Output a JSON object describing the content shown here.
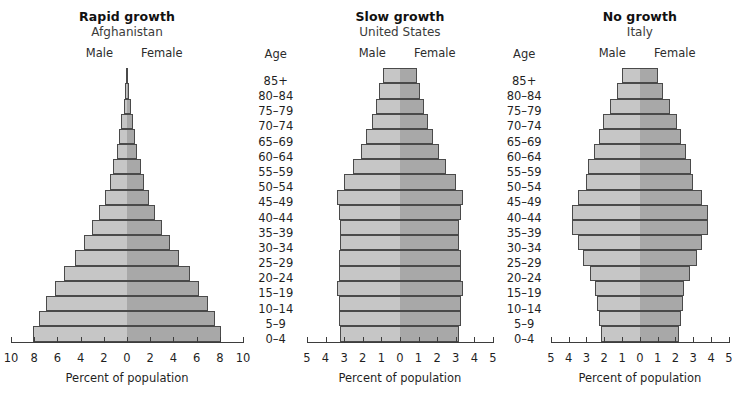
{
  "figure": {
    "caption": "Percent of population",
    "male_label": "Male",
    "female_label": "Female",
    "age_header": "Age",
    "colors": {
      "male_bar": "#c6c6c6",
      "female_bar": "#a8a8a8",
      "bar_outline": "#4a4a4a",
      "axis": "#3d3d3d",
      "background": "#ffffff",
      "text": "#1f1f1f"
    }
  },
  "age_groups": [
    "85+",
    "80–84",
    "75–79",
    "70–74",
    "65–69",
    "60–64",
    "55–59",
    "50–54",
    "45–49",
    "40–44",
    "35–39",
    "30–34",
    "25–29",
    "20–24",
    "15–19",
    "10–14",
    "5–9",
    "0–4"
  ],
  "chart_data": [
    {
      "type": "bar",
      "title": "Rapid growth",
      "subtitle": "Afghanistan",
      "xlabel": "Percent of population",
      "ylabel": "Age",
      "xlim": [
        -10,
        10
      ],
      "xticks": [
        -10,
        -8,
        -6,
        -4,
        -2,
        0,
        2,
        4,
        6,
        8,
        10
      ],
      "xticklabels": [
        "10",
        "8",
        "6",
        "4",
        "2",
        "0",
        "2",
        "4",
        "6",
        "8",
        "10"
      ],
      "grid": false,
      "legend": [
        "Male",
        "Female"
      ],
      "legend_position": "top",
      "categories": [
        "85+",
        "80–84",
        "75–79",
        "70–74",
        "65–69",
        "60–64",
        "55–59",
        "50–54",
        "45–49",
        "40–44",
        "35–39",
        "30–34",
        "25–29",
        "20–24",
        "15–19",
        "10–14",
        "5–9",
        "0–4"
      ],
      "series": [
        {
          "name": "Male",
          "values": [
            0.1,
            0.2,
            0.3,
            0.5,
            0.7,
            0.9,
            1.2,
            1.5,
            1.9,
            2.4,
            3.0,
            3.7,
            4.5,
            5.4,
            6.2,
            7.0,
            7.6,
            8.1
          ]
        },
        {
          "name": "Female",
          "values": [
            0.1,
            0.2,
            0.3,
            0.5,
            0.7,
            0.9,
            1.2,
            1.5,
            1.9,
            2.4,
            3.0,
            3.7,
            4.5,
            5.4,
            6.2,
            7.0,
            7.6,
            8.1
          ]
        }
      ]
    },
    {
      "type": "bar",
      "title": "Slow growth",
      "subtitle": "United States",
      "xlabel": "Percent of population",
      "ylabel": "Age",
      "xlim": [
        -5,
        5
      ],
      "xticks": [
        -5,
        -4,
        -3,
        -2,
        -1,
        0,
        1,
        2,
        3,
        4,
        5
      ],
      "xticklabels": [
        "5",
        "4",
        "3",
        "2",
        "1",
        "0",
        "1",
        "2",
        "3",
        "4",
        "5"
      ],
      "grid": false,
      "legend": [
        "Male",
        "Female"
      ],
      "legend_position": "top",
      "categories": [
        "85+",
        "80–84",
        "75–79",
        "70–74",
        "65–69",
        "60–64",
        "55–59",
        "50–54",
        "45–49",
        "40–44",
        "35–39",
        "30–34",
        "25–29",
        "20–24",
        "15–19",
        "10–14",
        "5–9",
        "0–4"
      ],
      "series": [
        {
          "name": "Male",
          "values": [
            0.9,
            1.1,
            1.3,
            1.5,
            1.8,
            2.1,
            2.5,
            3.0,
            3.4,
            3.3,
            3.2,
            3.2,
            3.3,
            3.3,
            3.4,
            3.3,
            3.3,
            3.2
          ]
        },
        {
          "name": "Female",
          "values": [
            0.9,
            1.1,
            1.3,
            1.5,
            1.8,
            2.1,
            2.5,
            3.0,
            3.4,
            3.3,
            3.2,
            3.2,
            3.3,
            3.3,
            3.4,
            3.3,
            3.3,
            3.2
          ]
        }
      ]
    },
    {
      "type": "bar",
      "title": "No growth",
      "subtitle": "Italy",
      "xlabel": "Percent of population",
      "ylabel": "Age",
      "xlim": [
        -5,
        5
      ],
      "xticks": [
        -5,
        -4,
        -3,
        -2,
        -1,
        0,
        1,
        2,
        3,
        4,
        5
      ],
      "xticklabels": [
        "5",
        "4",
        "3",
        "2",
        "1",
        "0",
        "1",
        "2",
        "3",
        "4",
        "5"
      ],
      "grid": false,
      "legend": [
        "Male",
        "Female"
      ],
      "legend_position": "top",
      "categories": [
        "85+",
        "80–84",
        "75–79",
        "70–74",
        "65–69",
        "60–64",
        "55–59",
        "50–54",
        "45–49",
        "40–44",
        "35–39",
        "30–34",
        "25–29",
        "20–24",
        "15–19",
        "10–14",
        "5–9",
        "0–4"
      ],
      "series": [
        {
          "name": "Male",
          "values": [
            1.0,
            1.3,
            1.7,
            2.1,
            2.3,
            2.6,
            2.9,
            3.0,
            3.5,
            3.8,
            3.8,
            3.5,
            3.2,
            2.8,
            2.5,
            2.4,
            2.3,
            2.2
          ]
        },
        {
          "name": "Female",
          "values": [
            1.0,
            1.3,
            1.7,
            2.1,
            2.3,
            2.6,
            2.9,
            3.0,
            3.5,
            3.8,
            3.8,
            3.5,
            3.2,
            2.8,
            2.5,
            2.4,
            2.3,
            2.2
          ]
        }
      ]
    }
  ]
}
